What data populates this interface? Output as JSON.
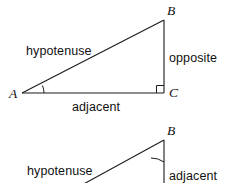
{
  "figure": {
    "background_color": "#ffffff",
    "stroke_color": "#1a1a1a",
    "text_color": "#111111"
  },
  "upper_triangle": {
    "vertices": {
      "a": "A",
      "b": "B",
      "c": "C"
    },
    "sides": {
      "hypotenuse": "hypotenuse",
      "opposite": "opposite",
      "adjacent": "adjacent"
    },
    "marked_angle_at": "A",
    "right_angle_at": "C"
  },
  "lower_triangle": {
    "vertices": {
      "b": "B"
    },
    "sides": {
      "hypotenuse": "hypotenuse",
      "adjacent": "adjacent"
    },
    "marked_angle_at": "B"
  }
}
